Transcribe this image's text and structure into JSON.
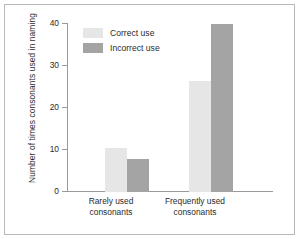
{
  "chart_data": {
    "type": "bar",
    "title": "",
    "subtitle": "",
    "xlabel": "",
    "ylabel": "Number of times consonants used in naming",
    "categories": [
      "Rarely used consonants",
      "Frequently used consonants"
    ],
    "category_lines": [
      [
        "Rarely used",
        "consonants"
      ],
      [
        "Frequently used",
        "consonants"
      ]
    ],
    "series": [
      {
        "name": "Correct use",
        "color": "#e6e6e6",
        "values": [
          10.3,
          26.3
        ]
      },
      {
        "name": "Incorrect use",
        "color": "#a4a4a4",
        "values": [
          7.9,
          39.7
        ]
      }
    ],
    "ylim": [
      0,
      40
    ],
    "yticks": [
      0,
      10,
      20,
      30,
      40
    ],
    "ytick_labels": [
      "0",
      "10",
      "20",
      "30",
      "40"
    ],
    "grid": false,
    "legend_position": "top-left",
    "axis_color": "#9a9a9a",
    "text_color": "#2b2b2b",
    "frame_color": "#b9b9b9",
    "background_color": "#ffffff"
  }
}
